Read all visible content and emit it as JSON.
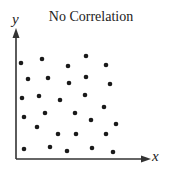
{
  "chart_data": {
    "type": "scatter",
    "title": "No Correlation",
    "xlabel": "x",
    "ylabel": "y",
    "grid": false,
    "legend": null,
    "axis_ticks": false,
    "xlim": [
      0,
      134
    ],
    "ylim": [
      0,
      130
    ],
    "points_pixel_space_note": "values are positions relative to origin (x right, y up), in px",
    "x": [
      5,
      26,
      52,
      70,
      90,
      12,
      32,
      53,
      70,
      94,
      6,
      23,
      44,
      69,
      88,
      29,
      59,
      75,
      100,
      8,
      42,
      21,
      60,
      90,
      34,
      8,
      51,
      76,
      97
    ],
    "y": [
      96,
      100,
      93,
      103,
      94,
      80,
      81,
      76,
      82,
      75,
      61,
      63,
      59,
      64,
      52,
      46,
      46,
      39,
      35,
      42,
      25,
      32,
      25,
      25,
      12,
      10,
      8,
      11,
      7
    ]
  },
  "colors": {
    "axis": "#333333",
    "points": "#1a1a1a",
    "background": "#ffffff"
  }
}
